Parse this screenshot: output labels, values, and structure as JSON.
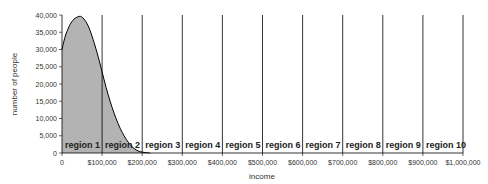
{
  "chart_data": {
    "type": "area",
    "title": "",
    "xlabel": "income",
    "ylabel": "number of people",
    "xlim": [
      0,
      1000000
    ],
    "ylim": [
      0,
      40000
    ],
    "x_ticks": [
      0,
      100000,
      200000,
      300000,
      400000,
      500000,
      600000,
      700000,
      800000,
      900000,
      1000000
    ],
    "x_tick_labels": [
      "0",
      "$100,000",
      "$200,000",
      "$300,000",
      "$400,000",
      "$500,000",
      "$600,000",
      "$700,000",
      "$800,000",
      "$900,000",
      "$1,000,000"
    ],
    "y_ticks": [
      0,
      5000,
      10000,
      15000,
      20000,
      25000,
      30000,
      35000,
      40000
    ],
    "y_tick_labels": [
      "0",
      "5,000",
      "10,000",
      "15,000",
      "20,000",
      "25,000",
      "30,000",
      "35,000",
      "40,000"
    ],
    "grid": false,
    "legend": null,
    "fill_color": "#b3b3b3",
    "line_color": "#000000",
    "series": [
      {
        "name": "income distribution",
        "x": [
          0,
          5000,
          10000,
          20000,
          30000,
          40000,
          45000,
          50000,
          60000,
          70000,
          80000,
          90000,
          100000,
          110000,
          120000,
          130000,
          140000,
          150000,
          160000,
          170000,
          180000,
          190000,
          200000,
          210000,
          220000
        ],
        "values": [
          30000,
          32500,
          34500,
          37200,
          38800,
          39500,
          39600,
          39400,
          38000,
          35500,
          32000,
          28000,
          23500,
          19000,
          15000,
          11500,
          8500,
          6000,
          4000,
          2400,
          1300,
          600,
          250,
          100,
          0
        ]
      }
    ],
    "regions": [
      {
        "label": "region 1",
        "from": 0,
        "to": 100000
      },
      {
        "label": "region 2",
        "from": 100000,
        "to": 200000
      },
      {
        "label": "region 3",
        "from": 200000,
        "to": 300000
      },
      {
        "label": "region 4",
        "from": 300000,
        "to": 400000
      },
      {
        "label": "region 5",
        "from": 400000,
        "to": 500000
      },
      {
        "label": "region 6",
        "from": 500000,
        "to": 600000
      },
      {
        "label": "region 7",
        "from": 600000,
        "to": 700000
      },
      {
        "label": "region 8",
        "from": 700000,
        "to": 800000
      },
      {
        "label": "region 9",
        "from": 800000,
        "to": 900000
      },
      {
        "label": "region 10",
        "from": 900000,
        "to": 1000000
      }
    ]
  }
}
